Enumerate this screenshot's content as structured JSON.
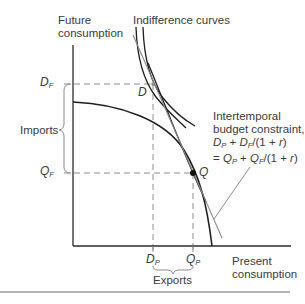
{
  "diagram": {
    "axes": {
      "y_label_line1": "Future",
      "y_label_line2": "consumption",
      "x_label_line1": "Present",
      "x_label_line2": "consumption"
    },
    "curves": {
      "indifference_label": "Indifference curves",
      "budget_label_line1": "Intertemporal",
      "budget_label_line2": "budget constraint,",
      "budget_eq_line1": "D_P + D_F/(1 + r)",
      "budget_eq_line2": "= Q_P + Q_F/(1 + r)"
    },
    "points": {
      "D": "D",
      "Q": "Q"
    },
    "ticks": {
      "DF_main": "D",
      "DF_sub": "F",
      "QF_main": "Q",
      "QF_sub": "F",
      "DP_main": "D",
      "DP_sub": "P",
      "QP_main": "Q",
      "QP_sub": "P"
    },
    "braces": {
      "imports": "Imports",
      "exports": "Exports"
    },
    "eq": {
      "l1_a": "D",
      "l1_a_sub": "P",
      "l1_b": " + ",
      "l1_c": "D",
      "l1_c_sub": "F",
      "l1_d": "/(1 + ",
      "l1_r": "r",
      "l1_e": ")",
      "l2_a": "= ",
      "l2_b": "Q",
      "l2_b_sub": "P",
      "l2_c": " + ",
      "l2_d": "Q",
      "l2_d_sub": "F",
      "l2_e": "/(1 + ",
      "l2_r": "r",
      "l2_f": ")"
    },
    "colors": {
      "axis": "#2b2b2b",
      "curve": "#1e1e1e",
      "budget_line": "#8a8a8a",
      "dashed": "#8c8c8c",
      "text": "#3a3a3a",
      "separator": "#b5b5b5"
    }
  }
}
